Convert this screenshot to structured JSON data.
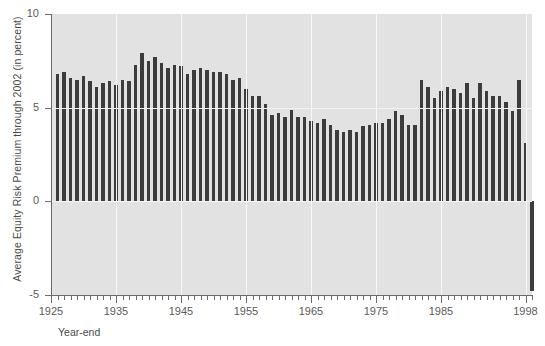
{
  "chart_data": {
    "type": "bar",
    "title": "",
    "subtitle": "",
    "xlabel": "Year-end",
    "ylabel": "Average Equity Risk Premium through 2002 (in percent)",
    "xlim": [
      1925,
      1999
    ],
    "ylim": [
      -5,
      10
    ],
    "yticks": [
      -5,
      0,
      5,
      10
    ],
    "ytick_labels": [
      "-5",
      "0",
      "5",
      "10"
    ],
    "xticks": [
      1925,
      1935,
      1945,
      1955,
      1965,
      1975,
      1985,
      1998
    ],
    "xtick_labels": [
      "1925",
      "1935",
      "1945",
      "1955",
      "1965",
      "1975",
      "1985",
      "1998"
    ],
    "xtick_minor_step": 1,
    "grid": "vertical-white-at-major-ticks",
    "legend": "none",
    "bar_color": "#3c3c3c",
    "plot_background": "#e2e2e2",
    "gridline_color": "#f7f7f7",
    "axis_color": "#6b6b6b",
    "categories": [
      1926,
      1927,
      1928,
      1929,
      1930,
      1931,
      1932,
      1933,
      1934,
      1935,
      1936,
      1937,
      1938,
      1939,
      1940,
      1941,
      1942,
      1943,
      1944,
      1945,
      1946,
      1947,
      1948,
      1949,
      1950,
      1951,
      1952,
      1953,
      1954,
      1955,
      1956,
      1957,
      1958,
      1959,
      1960,
      1961,
      1962,
      1963,
      1964,
      1965,
      1966,
      1967,
      1968,
      1969,
      1970,
      1971,
      1972,
      1973,
      1974,
      1975,
      1976,
      1977,
      1978,
      1979,
      1980,
      1981,
      1982,
      1983,
      1984,
      1985,
      1986,
      1987,
      1988,
      1989,
      1990,
      1991,
      1992,
      1993,
      1994,
      1995,
      1996,
      1997,
      1998
    ],
    "values": [
      6.8,
      6.9,
      6.6,
      6.5,
      6.7,
      6.4,
      6.1,
      6.3,
      6.4,
      6.2,
      6.5,
      6.4,
      7.3,
      7.9,
      7.5,
      7.7,
      7.4,
      7.1,
      7.3,
      7.2,
      6.8,
      7.0,
      7.1,
      7.0,
      6.9,
      6.9,
      6.8,
      6.5,
      6.6,
      6.0,
      5.6,
      5.6,
      5.2,
      4.6,
      4.7,
      4.5,
      4.9,
      4.5,
      4.5,
      4.3,
      4.2,
      4.4,
      4.1,
      3.8,
      3.7,
      3.8,
      3.7,
      4.0,
      4.1,
      4.2,
      4.2,
      4.4,
      4.8,
      4.6,
      4.1,
      4.1,
      6.5,
      6.1,
      5.5,
      5.9,
      6.1,
      6.0,
      5.8,
      6.3,
      5.5,
      6.3,
      5.9,
      5.6,
      5.6,
      5.3,
      4.8,
      6.5,
      3.1
    ],
    "negative_tail": {
      "year": 1998,
      "note": "final bar extends below zero"
    },
    "last_negative_value": -4.8
  }
}
